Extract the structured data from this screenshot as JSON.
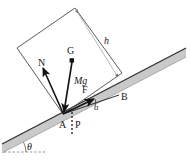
{
  "figure": {
    "type": "physics-free-body-diagram",
    "colors": {
      "incline_fill": "#c9c9c9",
      "incline_edge": "#3b3b3b",
      "block_edge": "#4a4a4a",
      "vector": "#111111",
      "dimension": "#8a8a8a",
      "background": "#ffffff",
      "label": "#1a1a1a"
    },
    "labels": {
      "center_of_gravity": "G",
      "weight": "Mg",
      "normal_force": "N",
      "applied_force": "F",
      "pivot_corner": "A",
      "pressure_point": "P",
      "upper_contact": "B",
      "height": "h",
      "force_angle": "a",
      "incline_angle": "θ"
    },
    "geometry": {
      "pivot_A": [
        63,
        114
      ],
      "point_P": [
        78,
        114
      ],
      "point_B": [
        120,
        93
      ],
      "center_G": [
        72,
        60
      ],
      "block_corners": [
        [
          63,
          114
        ],
        [
          17,
          48
        ],
        [
          75,
          8
        ],
        [
          122,
          73
        ]
      ],
      "incline_top_left": [
        2,
        144
      ],
      "incline_top_right": [
        186,
        48
      ],
      "incline_thickness": 9,
      "height_arrow_start": [
        117,
        75
      ],
      "height_arrow_end": [
        80,
        12
      ],
      "normal_tip": [
        43,
        65
      ],
      "force_tip": [
        95,
        98
      ]
    }
  }
}
